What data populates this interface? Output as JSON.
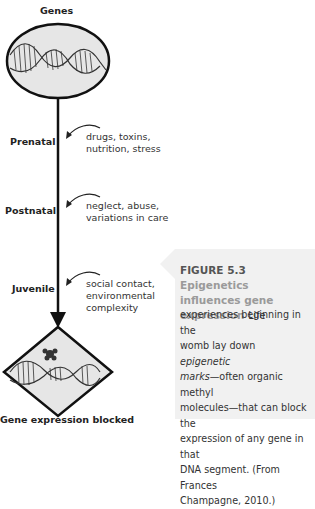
{
  "diagram": {
    "top_label": "Genes",
    "bottom_label": "Gene expression blocked",
    "stages": [
      {
        "label": "Prenatal",
        "influences": [
          "drugs, toxins,",
          "nutrition, stress"
        ]
      },
      {
        "label": "Postnatal",
        "influences": [
          "neglect, abuse,",
          "variations in care"
        ]
      },
      {
        "label": "Juvenile",
        "influences": [
          "social contact,",
          "environmental",
          "complexity"
        ]
      }
    ],
    "colors": {
      "shape_fill": "#e6e6e6",
      "outline": "#111111",
      "caption_bg": "#f1f1f1",
      "caption_title": "#9a9a9a"
    }
  },
  "caption": {
    "figure_number": "FIGURE 5.3",
    "title": "Epigenetics influences gene expression",
    "lead": "Life",
    "lines": [
      "experiences beginning in the",
      "womb lay down ",
      "epigenetic",
      "marks",
      "—often organic methyl",
      "molecules—that can block the",
      "expression of any gene in that",
      "DNA segment. (From Frances",
      "Champagne, 2010.)"
    ]
  }
}
